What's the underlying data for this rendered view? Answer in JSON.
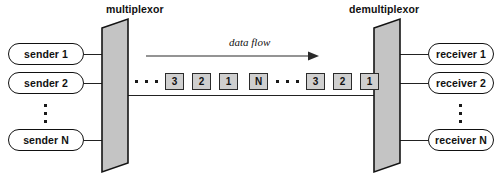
{
  "diagram": {
    "type": "multiplexing-demultiplexing",
    "titles": {
      "multiplexor": "multiplexor",
      "demultiplexor": "demultiplexor"
    },
    "flow": {
      "label": "data flow",
      "direction": "left-to-right"
    },
    "senders": [
      {
        "label": "sender 1"
      },
      {
        "label": "sender 2"
      },
      {
        "label": "sender N"
      }
    ],
    "receivers": [
      {
        "label": "receiver 1"
      },
      {
        "label": "receiver 2"
      },
      {
        "label": "receiver N"
      }
    ],
    "stream_cells": [
      {
        "label": "3"
      },
      {
        "label": "2"
      },
      {
        "label": "1"
      },
      {
        "label": "N"
      },
      {
        "label": "3"
      },
      {
        "label": "2"
      },
      {
        "label": "1"
      }
    ],
    "ellipsis": {
      "glyph": "·",
      "count": 3
    },
    "colors": {
      "stroke": "#111111",
      "cell_fill": "#cfcfcf",
      "mux_fill": "#c4c4c4",
      "background": "#ffffff"
    }
  }
}
